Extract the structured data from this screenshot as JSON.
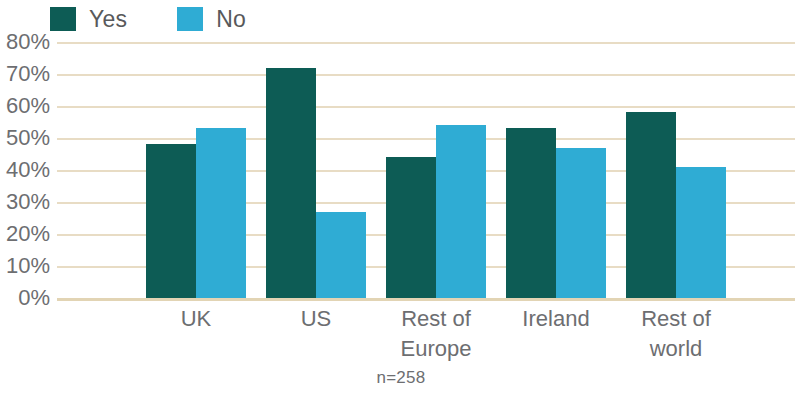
{
  "chart_data": {
    "type": "bar",
    "title": "",
    "subtitle": "",
    "xlabel": "",
    "ylabel": "",
    "categories": [
      "UK",
      "US",
      "Rest of\nEurope",
      "Ireland",
      "Rest of\nworld"
    ],
    "series": [
      {
        "name": "Yes",
        "color": "#0d5c55",
        "values": [
          48,
          72,
          44,
          53,
          58
        ]
      },
      {
        "name": "No",
        "color": "#2facd4",
        "values": [
          53,
          27,
          54,
          47,
          41
        ]
      }
    ],
    "ylim": [
      0,
      80
    ],
    "ytick_step": 10,
    "ytick_labels": [
      "80%",
      "70%",
      "60%",
      "50%",
      "40%",
      "30%",
      "20%",
      "10%",
      "0%"
    ],
    "ytick_values": [
      80,
      70,
      60,
      50,
      40,
      30,
      20,
      10,
      0
    ],
    "grid": true,
    "grid_color": "#e8dcc4",
    "legend_position": "top-left",
    "annotation": "n=258"
  },
  "legend": {
    "entries": [
      {
        "label": "Yes",
        "color": "#0d5c55"
      },
      {
        "label": "No",
        "color": "#2facd4"
      }
    ]
  },
  "footnote": {
    "text": "n=258"
  }
}
